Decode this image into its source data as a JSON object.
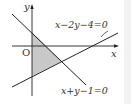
{
  "diagram": {
    "axes": {
      "x_label": "x",
      "y_label": "y",
      "origin_label": "O"
    },
    "lines": [
      {
        "equation": "x−2y−4=0"
      },
      {
        "equation": "x+y−1=0"
      }
    ],
    "shaded_region": {
      "description": "triangle bounded by the y-axis, x+y−1=0 and x−2y−4=0",
      "fill": "#c8c8c8"
    },
    "colors": {
      "stroke": "#222222",
      "shade": "#c8c8c8"
    }
  }
}
